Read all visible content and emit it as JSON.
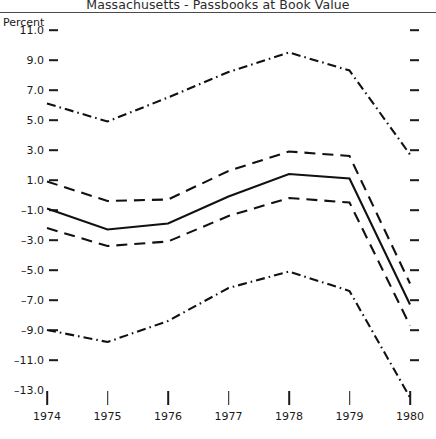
{
  "chart": {
    "title": "Massachusetts - Passbooks at Book Value",
    "unit_label": "Percent"
  },
  "chart_data": {
    "type": "line",
    "title": "Massachusetts - Passbooks at Book Value",
    "xlabel": "",
    "ylabel": "Percent",
    "x": [
      1974,
      1975,
      1976,
      1977,
      1978,
      1979,
      1980
    ],
    "xtick_labels": [
      "1974",
      "1975",
      "1976",
      "1977",
      "1978",
      "1979",
      "1980"
    ],
    "ytick_labels": [
      "11.0",
      "9.0",
      "7.0",
      "5.0",
      "3.0",
      "1.0",
      "-1.0",
      "-3.0",
      "-5.0",
      "-7.0",
      "-9.0",
      "-11.0",
      "-13.0"
    ],
    "ytick_values": [
      11.0,
      9.0,
      7.0,
      5.0,
      3.0,
      1.0,
      -1.0,
      -3.0,
      -5.0,
      -7.0,
      -9.0,
      -11.0,
      -13.0
    ],
    "ylim": [
      -13.0,
      11.0
    ],
    "xlim": [
      1974,
      1980
    ],
    "grid": false,
    "legend": "none",
    "series": [
      {
        "name": "upper-dashdot",
        "style": "dashdot",
        "values": [
          6.1,
          4.9,
          6.5,
          8.2,
          9.5,
          8.3,
          2.7
        ]
      },
      {
        "name": "upper-dashed",
        "style": "dashed",
        "values": [
          0.9,
          -0.4,
          -0.3,
          1.6,
          2.9,
          2.6,
          -5.9
        ]
      },
      {
        "name": "center-solid",
        "style": "solid",
        "values": [
          -0.9,
          -2.3,
          -1.9,
          -0.1,
          1.4,
          1.1,
          -7.3
        ]
      },
      {
        "name": "lower-dashed",
        "style": "dashed",
        "values": [
          -2.2,
          -3.4,
          -3.1,
          -1.4,
          -0.2,
          -0.5,
          -8.7
        ]
      },
      {
        "name": "lower-dashdot",
        "style": "dashdot",
        "values": [
          -9.0,
          -9.8,
          -8.4,
          -6.2,
          -5.1,
          -6.4,
          -13.5
        ]
      }
    ]
  }
}
